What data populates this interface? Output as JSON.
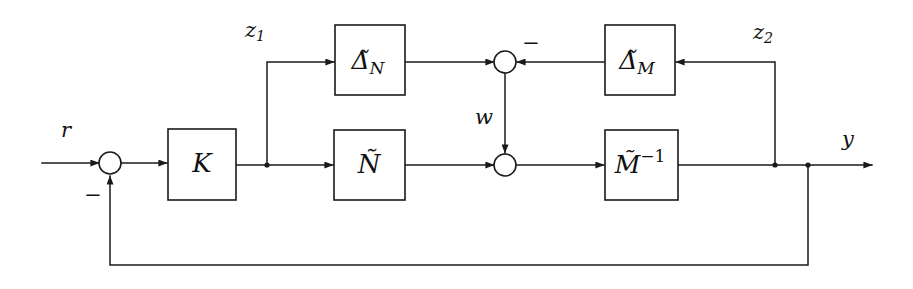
{
  "diagram": {
    "type": "control-block-diagram",
    "background_color": "#ffffff",
    "line_color": "#1a1a1a",
    "blocks": [
      {
        "id": "delta_n",
        "label_base": "Δ̃",
        "label_sub": "N",
        "label_sup": "",
        "x": 335,
        "y": 25,
        "w": 70,
        "h": 70
      },
      {
        "id": "delta_m",
        "label_base": "Δ̃",
        "label_sub": "M",
        "label_sup": "",
        "x": 605,
        "y": 25,
        "w": 70,
        "h": 70
      },
      {
        "id": "k",
        "label_base": "K",
        "label_sub": "",
        "label_sup": "",
        "x": 168,
        "y": 129,
        "w": 68,
        "h": 71
      },
      {
        "id": "n_tilde",
        "label_base": "Ñ",
        "label_sub": "",
        "label_sup": "",
        "x": 334,
        "y": 130,
        "w": 71,
        "h": 70
      },
      {
        "id": "m_inv",
        "label_base": "M̃",
        "label_sub": "",
        "label_sup": "-1",
        "x": 605,
        "y": 130,
        "w": 73,
        "h": 70
      }
    ],
    "junctions": [
      {
        "id": "sum_input",
        "cx": 110,
        "cy": 163,
        "r": 11
      },
      {
        "id": "sum_top",
        "cx": 505,
        "cy": 62,
        "r": 11
      },
      {
        "id": "sum_bottom",
        "cx": 505,
        "cy": 165,
        "r": 11
      }
    ],
    "signal_labels": [
      {
        "id": "r",
        "text": "r",
        "x": 66,
        "y": 131
      },
      {
        "id": "z1",
        "text": "z",
        "sub": "1",
        "x": 255,
        "y": 31
      },
      {
        "id": "z2",
        "text": "z",
        "sub": "2",
        "x": 763,
        "y": 33
      },
      {
        "id": "w",
        "text": "w",
        "x": 484,
        "y": 118
      },
      {
        "id": "y",
        "text": "y",
        "x": 848,
        "y": 140
      }
    ],
    "sign_labels": [
      {
        "id": "minus_input",
        "text": "−",
        "x": 93,
        "y": 196
      },
      {
        "id": "minus_top",
        "text": "−",
        "x": 531,
        "y": 44
      }
    ],
    "connections": [
      {
        "id": "r-to-sum",
        "from": "r input",
        "to": "sum_input"
      },
      {
        "id": "sum-to-k",
        "from": "sum_input",
        "to": "k"
      },
      {
        "id": "k-to-branch",
        "from": "k",
        "to": "z1 branch point"
      },
      {
        "id": "branch-to-ntilde",
        "from": "z1 branch point",
        "to": "n_tilde"
      },
      {
        "id": "branch-to-deltan",
        "from": "z1 branch point",
        "to": "delta_n"
      },
      {
        "id": "deltan-to-sumtop",
        "from": "delta_n",
        "to": "sum_top"
      },
      {
        "id": "deltam-to-sumtop",
        "from": "delta_m",
        "to": "sum_top"
      },
      {
        "id": "sumtop-to-sumbot",
        "from": "sum_top",
        "to": "sum_bottom"
      },
      {
        "id": "ntilde-to-sumbot",
        "from": "n_tilde",
        "to": "sum_bottom"
      },
      {
        "id": "sumbot-to-minv",
        "from": "sum_bottom",
        "to": "m_inv"
      },
      {
        "id": "minv-to-output",
        "from": "m_inv",
        "to": "y output"
      },
      {
        "id": "z2-tap-to-deltam",
        "from": "z2 tap point",
        "to": "delta_m"
      },
      {
        "id": "output-feedback",
        "from": "y tap point",
        "to": "sum_input"
      }
    ]
  }
}
